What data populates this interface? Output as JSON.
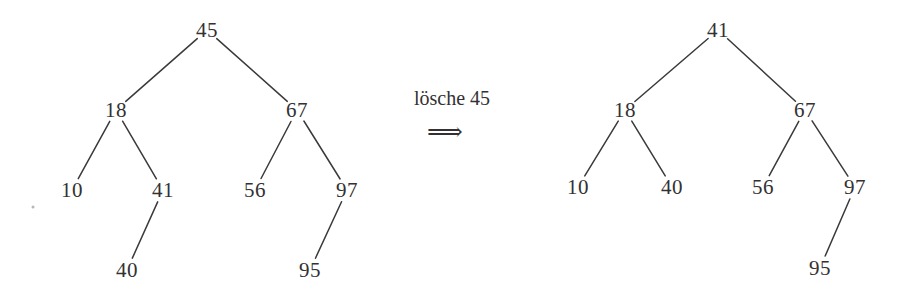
{
  "figure": {
    "caption_operation": "lösche 45",
    "arrow_glyph": "⟹",
    "ink_color": "#333132",
    "background_color": "#ffffff",
    "width": 901,
    "height": 296
  },
  "operation": {
    "label": "lösche 45",
    "verb": "lösche",
    "key": "45",
    "arrow": "⟹"
  },
  "left_tree": {
    "title": "before",
    "nodes": [
      {
        "id": "L45",
        "value": "45",
        "x": 207,
        "y": 30
      },
      {
        "id": "L18",
        "value": "18",
        "x": 116,
        "y": 110
      },
      {
        "id": "L67",
        "value": "67",
        "x": 297,
        "y": 110
      },
      {
        "id": "L10",
        "value": "10",
        "x": 72,
        "y": 190
      },
      {
        "id": "L41",
        "value": "41",
        "x": 163,
        "y": 190
      },
      {
        "id": "L56",
        "value": "56",
        "x": 255,
        "y": 190
      },
      {
        "id": "L97",
        "value": "97",
        "x": 347,
        "y": 190
      },
      {
        "id": "L40",
        "value": "40",
        "x": 127,
        "y": 270
      },
      {
        "id": "L95",
        "value": "95",
        "x": 310,
        "y": 270
      }
    ],
    "edges": [
      {
        "from": "L45",
        "to": "L18"
      },
      {
        "from": "L45",
        "to": "L67"
      },
      {
        "from": "L18",
        "to": "L10"
      },
      {
        "from": "L18",
        "to": "L41"
      },
      {
        "from": "L67",
        "to": "L56"
      },
      {
        "from": "L67",
        "to": "L97"
      },
      {
        "from": "L41",
        "to": "L40"
      },
      {
        "from": "L97",
        "to": "L95"
      }
    ]
  },
  "right_tree": {
    "title": "after",
    "nodes": [
      {
        "id": "R41",
        "value": "41",
        "x": 718,
        "y": 30
      },
      {
        "id": "R18",
        "value": "18",
        "x": 625,
        "y": 110
      },
      {
        "id": "R67",
        "value": "67",
        "x": 805,
        "y": 110
      },
      {
        "id": "R10",
        "value": "10",
        "x": 578,
        "y": 187
      },
      {
        "id": "R40",
        "value": "40",
        "x": 672,
        "y": 187
      },
      {
        "id": "R56",
        "value": "56",
        "x": 763,
        "y": 187
      },
      {
        "id": "R97",
        "value": "97",
        "x": 855,
        "y": 187
      },
      {
        "id": "R95",
        "value": "95",
        "x": 820,
        "y": 268
      }
    ],
    "edges": [
      {
        "from": "R41",
        "to": "R18"
      },
      {
        "from": "R41",
        "to": "R67"
      },
      {
        "from": "R18",
        "to": "R10"
      },
      {
        "from": "R18",
        "to": "R40"
      },
      {
        "from": "R67",
        "to": "R56"
      },
      {
        "from": "R67",
        "to": "R97"
      },
      {
        "from": "R97",
        "to": "R95"
      }
    ]
  },
  "annotations": {
    "operation_x": 452,
    "operation_y": 98,
    "arrow_x": 445,
    "arrow_y": 131,
    "speck_x": 33,
    "speck_y": 207
  }
}
